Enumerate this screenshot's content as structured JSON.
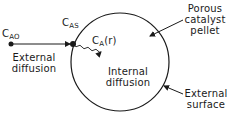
{
  "diagram": {
    "labels": {
      "c_ao": {
        "main": "C",
        "sub": "AO"
      },
      "c_as": {
        "main": "C",
        "sub": "AS"
      },
      "c_a_r": {
        "main": "C",
        "sub": "A",
        "suffix": "(r)"
      },
      "external_diffusion": [
        "External",
        "diffusion"
      ],
      "internal_diffusion": [
        "Internal",
        "diffusion"
      ],
      "porous_catalyst_pellet": [
        "Porous",
        "catalyst",
        "pellet"
      ],
      "external_surface": [
        "External",
        "surface"
      ]
    },
    "shapes": {
      "pellet_circle": {
        "cx": 120,
        "cy": 62,
        "r": 49
      },
      "stroke_color": "#1a1a1a"
    }
  }
}
